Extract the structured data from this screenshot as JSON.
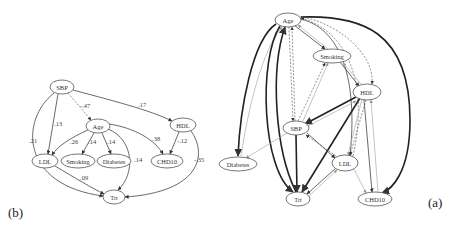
{
  "figure": {
    "panel_b": {
      "label": "(b)",
      "nodes": [
        {
          "id": "SBP",
          "label": "SBP",
          "x": 62,
          "y": 87,
          "rx": 12,
          "ry": 7
        },
        {
          "id": "Age",
          "label": "Age",
          "x": 98,
          "y": 126,
          "rx": 12,
          "ry": 7
        },
        {
          "id": "HDL",
          "label": "HDL",
          "x": 183,
          "y": 125,
          "rx": 13,
          "ry": 7
        },
        {
          "id": "LDL",
          "label": "LDL",
          "x": 45,
          "y": 161,
          "rx": 13,
          "ry": 7
        },
        {
          "id": "Smoking",
          "label": "Smoking",
          "x": 78,
          "y": 161,
          "rx": 17,
          "ry": 7
        },
        {
          "id": "Diabetes",
          "label": "Diabetes",
          "x": 114,
          "y": 161,
          "rx": 17,
          "ry": 7
        },
        {
          "id": "CHD10",
          "label": "CHD10",
          "x": 167,
          "y": 161,
          "rx": 16,
          "ry": 7
        },
        {
          "id": "Trt",
          "label": "Trt",
          "x": 114,
          "y": 197,
          "rx": 11,
          "ry": 7
        }
      ],
      "edges": [
        {
          "from": "SBP",
          "to": "Age",
          "weight": "-.47",
          "style": "dashed",
          "path": "M68,93 L91,120",
          "lx": 80,
          "ly": 108
        },
        {
          "from": "SBP",
          "to": "HDL",
          "weight": ".17",
          "style": "solid",
          "path": "M73,90 C110,100 150,110 172,121",
          "lx": 138,
          "ly": 107
        },
        {
          "from": "SBP",
          "to": "LDL",
          "weight": ".13",
          "style": "solid",
          "path": "M58,94 L48,154",
          "lx": 54,
          "ly": 126
        },
        {
          "from": "SBP",
          "to": "Trt",
          "weight": ".21",
          "style": "solid",
          "path": "M54,93 C20,120 20,185 103,196",
          "lx": 29,
          "ly": 143
        },
        {
          "from": "Age",
          "to": "LDL",
          "weight": ".26",
          "style": "solid",
          "path": "M88,130 C70,138 58,146 52,155",
          "lx": 70,
          "ly": 144
        },
        {
          "from": "Age",
          "to": "Smoking",
          "weight": ".14",
          "style": "solid",
          "path": "M94,133 L82,154",
          "lx": 88,
          "ly": 144
        },
        {
          "from": "Age",
          "to": "Diabetes",
          "weight": ".14",
          "style": "solid",
          "path": "M102,133 L111,154",
          "lx": 107,
          "ly": 144
        },
        {
          "from": "Age",
          "to": "CHD10",
          "weight": ".38",
          "style": "solid",
          "path": "M109,124 C135,128 155,140 163,154",
          "lx": 152,
          "ly": 141
        },
        {
          "from": "Age",
          "to": "Trt",
          "weight": ".14",
          "style": "solid",
          "path": "M108,129 C135,140 135,175 118,190",
          "lx": 134,
          "ly": 162
        },
        {
          "from": "HDL",
          "to": "CHD10",
          "weight": "-.12",
          "style": "solid",
          "path": "M179,132 L170,154",
          "lx": 177,
          "ly": 143
        },
        {
          "from": "HDL",
          "to": "Trt",
          "weight": "-.35",
          "style": "solid",
          "path": "M191,131 C208,155 200,192 125,197",
          "lx": 194,
          "ly": 162
        },
        {
          "from": "LDL",
          "to": "Trt",
          "weight": ".09",
          "style": "solid",
          "path": "M55,166 C75,178 92,188 104,194",
          "lx": 80,
          "ly": 180
        }
      ]
    },
    "panel_a": {
      "label": "(a)",
      "nodes": [
        {
          "id": "Age",
          "label": "Age",
          "x": 288,
          "y": 20,
          "rx": 13,
          "ry": 7
        },
        {
          "id": "Smoking",
          "label": "Smoking",
          "x": 332,
          "y": 56,
          "rx": 19,
          "ry": 7
        },
        {
          "id": "HDL",
          "label": "HDL",
          "x": 367,
          "y": 92,
          "rx": 14,
          "ry": 8
        },
        {
          "id": "SBP",
          "label": "SBP",
          "x": 296,
          "y": 128,
          "rx": 13,
          "ry": 7
        },
        {
          "id": "Diabetes",
          "label": "Diabetes",
          "x": 238,
          "y": 164,
          "rx": 19,
          "ry": 7
        },
        {
          "id": "LDL",
          "label": "LDL",
          "x": 345,
          "y": 163,
          "rx": 13,
          "ry": 8
        },
        {
          "id": "Trt",
          "label": "Trt",
          "x": 298,
          "y": 199,
          "rx": 12,
          "ry": 7
        },
        {
          "id": "CHD10",
          "label": "CHD10",
          "x": 375,
          "y": 199,
          "rx": 17,
          "ry": 7
        }
      ],
      "edges": [
        {
          "path": "M276,24 C252,40 240,110 238,156",
          "style": "thick"
        },
        {
          "path": "M241,156 C248,110 262,50 282,27",
          "style": "light"
        },
        {
          "path": "M280,26 C258,60 262,170 293,192",
          "style": "thick"
        },
        {
          "path": "M296,192 C275,150 270,70 285,27",
          "style": "thick"
        },
        {
          "path": "M289,27 L293,121",
          "style": "dashed"
        },
        {
          "path": "M295,121 L292,27",
          "style": "dashed"
        },
        {
          "path": "M294,25 L325,49",
          "style": "solid"
        },
        {
          "path": "M328,49 L298,25",
          "style": "light"
        },
        {
          "path": "M300,19 C330,25 360,60 350,156",
          "style": "solid"
        },
        {
          "path": "M353,156 C370,80 345,30 301,18",
          "style": "dashed"
        },
        {
          "path": "M300,17 C330,20 375,50 372,84",
          "style": "dashed"
        },
        {
          "path": "M301,17 C360,15 410,30 410,120 C410,175 390,190 382,193",
          "style": "thick"
        },
        {
          "path": "M303,121 L328,63",
          "style": "light"
        },
        {
          "path": "M298,121 L325,63",
          "style": "dashed"
        },
        {
          "path": "M340,62 L359,86",
          "style": "solid"
        },
        {
          "path": "M362,85 L343,63",
          "style": "light"
        },
        {
          "path": "M356,97 L305,124",
          "style": "thick"
        },
        {
          "path": "M306,127 L356,101",
          "style": "light"
        },
        {
          "path": "M360,98 L302,192",
          "style": "thick"
        },
        {
          "path": "M362,99 L348,155",
          "style": "light"
        },
        {
          "path": "M366,100 L350,155",
          "style": "dashed"
        },
        {
          "path": "M364,100 L372,192",
          "style": "solid"
        },
        {
          "path": "M378,192 L371,100",
          "style": "light"
        },
        {
          "path": "M296,135 L297,192",
          "style": "thick"
        },
        {
          "path": "M307,133 L335,158",
          "style": "solid"
        },
        {
          "path": "M336,156 L306,135",
          "style": "dashed"
        },
        {
          "path": "M287,133 L246,158",
          "style": "light"
        },
        {
          "path": "M336,168 L307,194",
          "style": "solid"
        },
        {
          "path": "M309,196 L337,170",
          "style": "light"
        },
        {
          "path": "M354,169 L366,193",
          "style": "light"
        }
      ]
    }
  }
}
